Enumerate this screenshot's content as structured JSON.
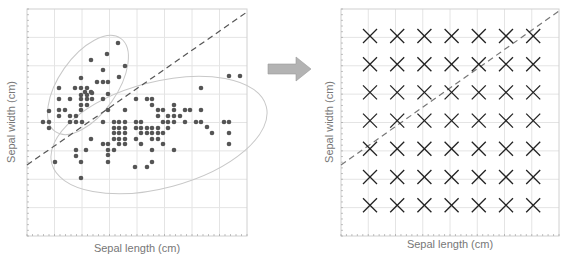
{
  "left_plot": {
    "xlabel": "Sepal length (cm)",
    "ylabel": "Sepal width (cm)",
    "frame": {
      "x": 27,
      "y": 9,
      "w": 220,
      "h": 227
    },
    "grid": {
      "cols": 8,
      "rows": 8
    },
    "boundary": {
      "x1": 27,
      "y1": 165,
      "x2": 247,
      "y2": 12
    },
    "ellipses": [
      {
        "cx": 88,
        "cy": 85,
        "rx": 57,
        "ry": 29,
        "rotate": -55
      },
      {
        "cx": 159,
        "cy": 135,
        "rx": 111,
        "ry": 53,
        "rotate": -15
      }
    ],
    "points": [
      [
        118,
        43
      ],
      [
        107,
        54
      ],
      [
        125,
        66
      ],
      [
        91,
        60
      ],
      [
        103,
        70
      ],
      [
        119,
        77
      ],
      [
        81,
        78
      ],
      [
        97,
        82
      ],
      [
        103,
        82
      ],
      [
        87,
        88
      ],
      [
        108,
        82
      ],
      [
        59,
        88
      ],
      [
        75,
        88
      ],
      [
        81,
        88
      ],
      [
        85,
        92
      ],
      [
        91,
        92
      ],
      [
        92,
        99
      ],
      [
        59,
        99
      ],
      [
        70,
        99
      ],
      [
        103,
        99
      ],
      [
        108,
        94
      ],
      [
        81,
        95
      ],
      [
        87,
        95
      ],
      [
        81,
        99
      ],
      [
        87,
        99
      ],
      [
        92,
        93
      ],
      [
        49,
        111
      ],
      [
        59,
        110
      ],
      [
        65,
        110
      ],
      [
        81,
        105
      ],
      [
        87,
        105
      ],
      [
        81,
        110
      ],
      [
        76,
        116
      ],
      [
        70,
        116
      ],
      [
        59,
        116
      ],
      [
        70,
        122
      ],
      [
        76,
        122
      ],
      [
        82,
        122
      ],
      [
        43,
        122
      ],
      [
        49,
        122
      ],
      [
        49,
        128
      ],
      [
        103,
        122
      ],
      [
        108,
        110
      ],
      [
        136,
        99
      ],
      [
        147,
        99
      ],
      [
        152,
        99
      ],
      [
        152,
        105
      ],
      [
        125,
        110
      ],
      [
        158,
        110
      ],
      [
        163,
        110
      ],
      [
        136,
        122
      ],
      [
        141,
        122
      ],
      [
        158,
        116
      ],
      [
        168,
        116
      ],
      [
        174,
        116
      ],
      [
        174,
        110
      ],
      [
        185,
        110
      ],
      [
        190,
        110
      ],
      [
        174,
        105
      ],
      [
        201,
        88
      ],
      [
        201,
        110
      ],
      [
        180,
        116
      ],
      [
        185,
        122
      ],
      [
        163,
        122
      ],
      [
        168,
        122
      ],
      [
        174,
        122
      ],
      [
        196,
        122
      ],
      [
        201,
        122
      ],
      [
        207,
        127
      ],
      [
        212,
        133
      ],
      [
        224,
        122
      ],
      [
        229,
        122
      ],
      [
        229,
        133
      ],
      [
        229,
        144
      ],
      [
        229,
        76
      ],
      [
        240,
        76
      ],
      [
        114,
        122
      ],
      [
        119,
        122
      ],
      [
        125,
        122
      ],
      [
        114,
        128
      ],
      [
        119,
        128
      ],
      [
        125,
        128
      ],
      [
        136,
        128
      ],
      [
        141,
        128
      ],
      [
        147,
        128
      ],
      [
        152,
        128
      ],
      [
        158,
        128
      ],
      [
        168,
        128
      ],
      [
        114,
        133
      ],
      [
        119,
        133
      ],
      [
        125,
        133
      ],
      [
        141,
        133
      ],
      [
        147,
        133
      ],
      [
        152,
        133
      ],
      [
        158,
        133
      ],
      [
        163,
        133
      ],
      [
        114,
        139
      ],
      [
        119,
        139
      ],
      [
        125,
        139
      ],
      [
        136,
        139
      ],
      [
        152,
        139
      ],
      [
        158,
        139
      ],
      [
        108,
        144
      ],
      [
        119,
        144
      ],
      [
        125,
        144
      ],
      [
        141,
        144
      ],
      [
        163,
        144
      ],
      [
        91,
        139
      ],
      [
        103,
        144
      ],
      [
        108,
        150
      ],
      [
        114,
        150
      ],
      [
        76,
        150
      ],
      [
        86,
        150
      ],
      [
        152,
        150
      ],
      [
        174,
        150
      ],
      [
        108,
        155
      ],
      [
        76,
        156
      ],
      [
        108,
        162
      ],
      [
        81,
        162
      ],
      [
        135,
        167
      ],
      [
        147,
        167
      ],
      [
        152,
        162
      ],
      [
        55,
        162
      ],
      [
        81,
        178
      ]
    ]
  },
  "arrow": {
    "color": "#b3b3b3",
    "direction": "right"
  },
  "right_plot": {
    "xlabel": "Sepal length (cm)",
    "ylabel": "Sepal width (cm)",
    "frame": {
      "x": 341,
      "y": 9,
      "w": 218,
      "h": 227
    },
    "grid": {
      "cols": 8,
      "rows": 8
    },
    "boundary": {
      "x1": 341,
      "y1": 165,
      "x2": 559,
      "y2": 11
    },
    "marker_grid": {
      "cols": 7,
      "rows": 7,
      "x0": 370,
      "dx": 27.2,
      "y0": 36,
      "dy": 28.2,
      "size": 7
    },
    "marker": "x-mark"
  },
  "colors": {
    "point": "#555555",
    "ellipse": "#c8c8c8",
    "grid": "#e4e4e4",
    "frame": "#d0d0d0",
    "dashed_line": "#555555",
    "label": "#777777",
    "marker": "#222222"
  }
}
